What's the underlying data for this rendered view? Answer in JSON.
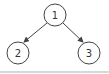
{
  "diagram": {
    "type": "binary-tree",
    "nodes": [
      {
        "id": "1",
        "label": "1",
        "x": 55,
        "y": 15
      },
      {
        "id": "2",
        "label": "2",
        "x": 18,
        "y": 53
      },
      {
        "id": "3",
        "label": "3",
        "x": 89,
        "y": 53
      }
    ],
    "edges": [
      {
        "from": "1",
        "to": "2"
      },
      {
        "from": "1",
        "to": "3"
      }
    ],
    "node_radius": 11,
    "colors": {
      "stroke": "#444444",
      "fill": "#ffffff",
      "text": "#333333",
      "divider": "#d8d8d8"
    }
  }
}
